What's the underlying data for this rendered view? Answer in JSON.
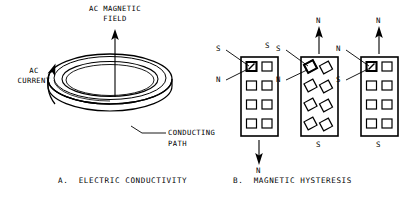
{
  "figure": {
    "title_absent": true,
    "panels": [
      {
        "id": "panel-a",
        "caption": "A.  ELECTRIC CONDUCTIVITY",
        "labels": {
          "field": "AC MAGNETIC\nFIELD",
          "field_line1": "AC MAGNETIC",
          "field_line2": "FIELD",
          "current_line1": "AC",
          "current_line2": "CURRENT",
          "path_line1": "CONDUCTING",
          "path_line2": "PATH"
        }
      },
      {
        "id": "panel-b",
        "caption": "B.  MAGNETIC HYSTERESIS",
        "blocks": [
          {
            "id": "block-1",
            "state": "random-domains",
            "top_label": "S",
            "bottom_label": "N",
            "arrow_direction": "down",
            "arrow_label": "N",
            "leader_labels": [
              {
                "text": "S",
                "target": "domain-top-left"
              },
              {
                "text": "N",
                "target": "domain-top-left"
              }
            ]
          },
          {
            "id": "block-2",
            "state": "tilted-domains",
            "top_label": "N",
            "bottom_label": "S",
            "arrow_direction": "up",
            "arrow_label": "N",
            "leader_labels": [
              {
                "text": "S",
                "target": "domain-top-left"
              },
              {
                "text": "N",
                "target": "domain-top-left"
              }
            ]
          },
          {
            "id": "block-3",
            "state": "aligned-domains",
            "top_label": "N",
            "bottom_label": "S",
            "arrow_direction": "up",
            "arrow_label": "N",
            "leader_labels": [
              {
                "text": "N",
                "target": "domain-top-left"
              },
              {
                "text": "S",
                "target": "domain-top-left"
              }
            ]
          }
        ]
      }
    ]
  },
  "colors": {
    "ink": "#000000",
    "background": "#ffffff"
  }
}
